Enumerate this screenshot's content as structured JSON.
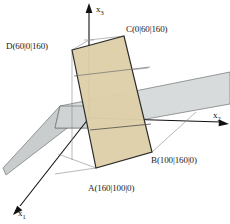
{
  "figure": {
    "background_color": "#ffffff",
    "axes": [
      {
        "name": "x1",
        "label": "x",
        "subscript": "1",
        "direction": "down-left",
        "tip": [
          14,
          212
        ]
      },
      {
        "name": "x2",
        "label": "x",
        "subscript": "2",
        "direction": "right",
        "tip": [
          228,
          124
        ]
      },
      {
        "name": "x3",
        "label": "x",
        "subscript": "3",
        "direction": "up",
        "tip": [
          89,
          5
        ]
      }
    ],
    "origin": [
      89,
      118
    ],
    "points": [
      {
        "name": "A",
        "label": "A(160|100|0)",
        "coords": [
          160,
          100,
          0
        ],
        "pixel": [
          96,
          168
        ],
        "label_pos": [
          90,
          182
        ]
      },
      {
        "name": "B",
        "label": "B(100|160|0)",
        "coords": [
          100,
          160,
          0
        ],
        "pixel": [
          152,
          152
        ],
        "label_pos": [
          152,
          156
        ]
      },
      {
        "name": "C",
        "label": "C(0|60|160)",
        "coords": [
          0,
          60,
          160
        ],
        "pixel": [
          124,
          36
        ],
        "label_pos": [
          126,
          26
        ]
      },
      {
        "name": "D",
        "label": "D(60|0|160)",
        "coords": [
          60,
          0,
          160
        ],
        "pixel": [
          72,
          50
        ],
        "label_pos": [
          8,
          42
        ]
      }
    ],
    "shapes": [
      {
        "name": "gray-plane",
        "description": "light gray plane band crossing the scene",
        "fill": "#d8dbdb",
        "fill_left": "#c9cdcd",
        "stroke": "#6f7272"
      },
      {
        "name": "tan-rectangle",
        "description": "beige rectangle ABCD standing upright",
        "fill": "#ded0a8",
        "stroke": "#2b2b2b"
      }
    ],
    "colors": {
      "plane_fill": "#d8dbdb",
      "plane_fill_left": "#c9cdcd",
      "plane_stroke": "#6f7272",
      "rect_fill": "#ded0a8",
      "rect_stroke": "#2b2b2b",
      "axis_stroke": "#111111",
      "construction_stroke": "#8a8a8a",
      "text": "#1a1a1a"
    }
  }
}
